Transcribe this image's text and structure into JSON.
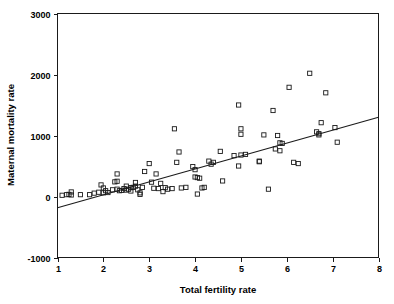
{
  "chart_data": {
    "type": "scatter",
    "title": "",
    "xlabel": "Total fertility rate",
    "ylabel": "Maternal mortality rate",
    "xlim": [
      1,
      8
    ],
    "ylim": [
      -1000,
      3000
    ],
    "grid": false,
    "legend": null,
    "x_ticks": [
      1,
      2,
      3,
      4,
      5,
      6,
      7,
      8
    ],
    "x_tick_labels": [
      "1",
      "2",
      "3",
      "4",
      "5",
      "6",
      "7",
      "8"
    ],
    "y_ticks": [
      -1000,
      0,
      1000,
      2000,
      3000
    ],
    "y_tick_labels": [
      "-1000",
      "0",
      "1000",
      "2000",
      "3000"
    ],
    "marker": "open-square",
    "fit_line": {
      "type": "linear-regression",
      "x_start": 1,
      "y_start": -185,
      "x_end": 8,
      "y_end": 1300
    },
    "points": [
      [
        1.1,
        20
      ],
      [
        1.2,
        30
      ],
      [
        1.25,
        35
      ],
      [
        1.3,
        75
      ],
      [
        1.3,
        25
      ],
      [
        1.5,
        30
      ],
      [
        1.7,
        30
      ],
      [
        1.8,
        55
      ],
      [
        1.9,
        70
      ],
      [
        1.95,
        190
      ],
      [
        2.0,
        140
      ],
      [
        2.0,
        60
      ],
      [
        2.05,
        95
      ],
      [
        2.1,
        65
      ],
      [
        2.2,
        110
      ],
      [
        2.25,
        240
      ],
      [
        2.3,
        120
      ],
      [
        2.3,
        250
      ],
      [
        2.3,
        370
      ],
      [
        2.35,
        95
      ],
      [
        2.4,
        100
      ],
      [
        2.45,
        130
      ],
      [
        2.5,
        105
      ],
      [
        2.5,
        170
      ],
      [
        2.55,
        120
      ],
      [
        2.6,
        145
      ],
      [
        2.6,
        90
      ],
      [
        2.65,
        150
      ],
      [
        2.7,
        170
      ],
      [
        2.7,
        230
      ],
      [
        2.75,
        110
      ],
      [
        2.8,
        60
      ],
      [
        2.8,
        35
      ],
      [
        2.85,
        150
      ],
      [
        2.9,
        410
      ],
      [
        3.0,
        540
      ],
      [
        3.05,
        235
      ],
      [
        3.1,
        135
      ],
      [
        3.15,
        370
      ],
      [
        3.2,
        130
      ],
      [
        3.25,
        215
      ],
      [
        3.3,
        80
      ],
      [
        3.35,
        145
      ],
      [
        3.4,
        120
      ],
      [
        3.5,
        130
      ],
      [
        3.55,
        1110
      ],
      [
        3.6,
        560
      ],
      [
        3.65,
        730
      ],
      [
        3.7,
        140
      ],
      [
        3.8,
        150
      ],
      [
        3.95,
        490
      ],
      [
        4.0,
        440
      ],
      [
        4.0,
        320
      ],
      [
        4.05,
        310
      ],
      [
        4.05,
        40
      ],
      [
        4.1,
        300
      ],
      [
        4.15,
        140
      ],
      [
        4.2,
        150
      ],
      [
        4.3,
        580
      ],
      [
        4.35,
        530
      ],
      [
        4.4,
        560
      ],
      [
        4.55,
        740
      ],
      [
        4.6,
        255
      ],
      [
        4.85,
        670
      ],
      [
        4.95,
        1500
      ],
      [
        4.95,
        500
      ],
      [
        5.0,
        680
      ],
      [
        5.0,
        1110
      ],
      [
        5.0,
        1020
      ],
      [
        5.1,
        690
      ],
      [
        5.4,
        580
      ],
      [
        5.4,
        570
      ],
      [
        5.5,
        1010
      ],
      [
        5.6,
        120
      ],
      [
        5.7,
        1410
      ],
      [
        5.75,
        780
      ],
      [
        5.8,
        1000
      ],
      [
        5.85,
        750
      ],
      [
        5.85,
        880
      ],
      [
        5.9,
        870
      ],
      [
        6.05,
        1790
      ],
      [
        6.15,
        560
      ],
      [
        6.25,
        540
      ],
      [
        6.5,
        2020
      ],
      [
        6.65,
        1060
      ],
      [
        6.7,
        1030
      ],
      [
        6.7,
        1010
      ],
      [
        6.75,
        1210
      ],
      [
        6.85,
        1700
      ],
      [
        7.05,
        1130
      ],
      [
        7.1,
        890
      ]
    ]
  }
}
